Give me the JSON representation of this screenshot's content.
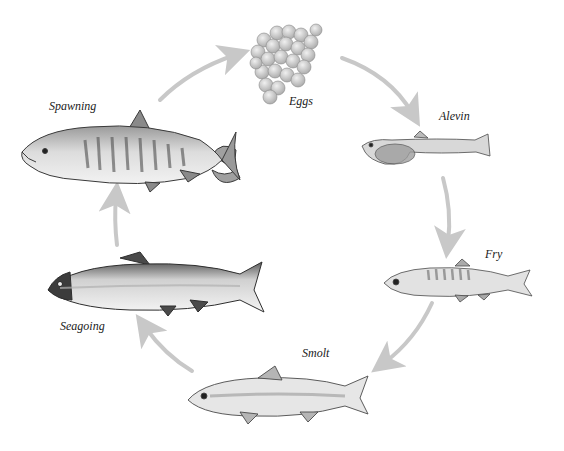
{
  "diagram": {
    "colors": {
      "background": "#ffffff",
      "arrow": "#c8c8c8",
      "fish_outline": "#3a3a3a",
      "fish_body": "#d9d9d9",
      "fish_dark": "#6e6e6e",
      "egg": "#cfcfcf",
      "label": "#1a1a1a"
    },
    "stages": [
      {
        "id": "eggs",
        "label": "Eggs",
        "order": 1
      },
      {
        "id": "alevin",
        "label": "Alevin",
        "order": 2
      },
      {
        "id": "fry",
        "label": "Fry",
        "order": 3
      },
      {
        "id": "smolt",
        "label": "Smolt",
        "order": 4
      },
      {
        "id": "seagoing",
        "label": "Seagoing",
        "order": 5
      },
      {
        "id": "spawning",
        "label": "Spawning",
        "order": 6
      }
    ],
    "cycle_arrows": [
      {
        "from": "spawning",
        "to": "eggs"
      },
      {
        "from": "eggs",
        "to": "alevin"
      },
      {
        "from": "alevin",
        "to": "fry"
      },
      {
        "from": "fry",
        "to": "smolt"
      },
      {
        "from": "smolt",
        "to": "seagoing"
      },
      {
        "from": "seagoing",
        "to": "spawning"
      }
    ]
  }
}
